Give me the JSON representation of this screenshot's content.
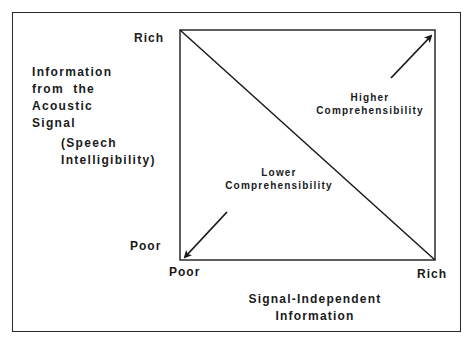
{
  "diagram": {
    "y_axis": {
      "label_lines": [
        "Information",
        "from  the",
        "Acoustic",
        "Signal"
      ],
      "sublabel_lines": [
        "(Speech",
        "Intelligibility)"
      ],
      "top_tick": "Rich",
      "bottom_tick": "Poor"
    },
    "x_axis": {
      "label_lines": [
        "Signal-Independent",
        "Information"
      ],
      "left_tick": "Poor",
      "right_tick": "Rich"
    },
    "regions": {
      "upper_right": {
        "line1": "Higher",
        "line2": "Comprehensibility",
        "arrow": "arrow-up-right"
      },
      "lower_left": {
        "line1": "Lower",
        "line2": "Comprehensibility",
        "arrow": "arrow-down-left"
      }
    },
    "colors": {
      "line": "#1a1a1a",
      "background": "#ffffff"
    }
  }
}
